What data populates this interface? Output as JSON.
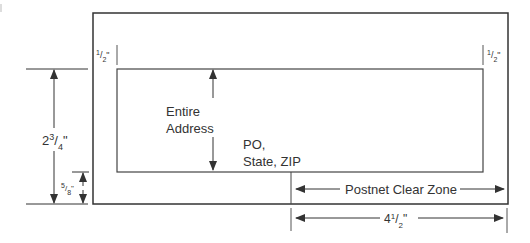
{
  "diagram": {
    "title": "",
    "colors": {
      "line": "#333333",
      "text": "#333333",
      "background": "#ffffff"
    },
    "labels": {
      "margin_left": {
        "whole": "",
        "num": "1",
        "den": "2",
        "unit": "\""
      },
      "margin_right": {
        "whole": "",
        "num": "1",
        "den": "2",
        "unit": "\""
      },
      "address_height": {
        "whole": "2",
        "num": "3",
        "den": "4",
        "unit": "\""
      },
      "bottom_gap": {
        "whole": "",
        "num": "5",
        "den": "8",
        "unit": "\""
      },
      "clear_zone_width": {
        "whole": "4",
        "num": "1",
        "den": "2",
        "unit": "\""
      },
      "entire_line1": "Entire",
      "entire_line2": "Address",
      "po_line1": "PO,",
      "po_line2": "State, ZIP",
      "postnet": "Postnet Clear Zone"
    }
  }
}
